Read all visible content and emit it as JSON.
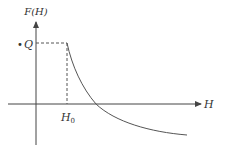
{
  "diagram": {
    "y_axis_label": "F(H)",
    "x_axis_label": "H",
    "level_label": "Q",
    "level_bullet": "•",
    "threshold_label": "H",
    "threshold_subscript": "0",
    "colors": {
      "axis": "#444444",
      "dashed": "#555555",
      "curve": "#555555",
      "text": "#333333"
    }
  }
}
